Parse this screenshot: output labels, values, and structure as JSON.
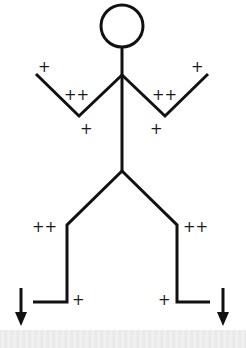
{
  "figure": {
    "stroke_color": "#111111",
    "labels": {
      "left_hand": "+",
      "left_elbow_upper": "++",
      "left_elbow_lower": "+",
      "right_hand": "+",
      "right_elbow_upper": "++",
      "right_elbow_lower": "+",
      "left_knee": "++",
      "right_knee": "++",
      "left_ankle": "+",
      "right_ankle": "+"
    },
    "arrows": [
      {
        "side": "left",
        "direction": "down"
      },
      {
        "side": "right",
        "direction": "down"
      }
    ]
  }
}
